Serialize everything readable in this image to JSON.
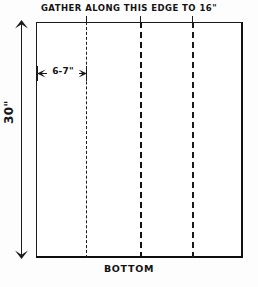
{
  "diagram": {
    "title": "GATHER ALONG THIS EDGE TO 16\"",
    "bottom_label": "BOTTOM",
    "height_label": "30\"",
    "width_label": "6-7\"",
    "colors": {
      "ink": "#1b1b1b",
      "paper": "#fdfdfd"
    },
    "panels": [
      {
        "name": "panel-1"
      },
      {
        "name": "panel-2"
      },
      {
        "name": "panel-3"
      },
      {
        "name": "panel-4"
      }
    ],
    "division_lines": [
      {
        "name": "division-line-1",
        "style": "dashed"
      },
      {
        "name": "division-line-2",
        "style": "dashed"
      },
      {
        "name": "division-line-3",
        "style": "dashed"
      }
    ]
  }
}
